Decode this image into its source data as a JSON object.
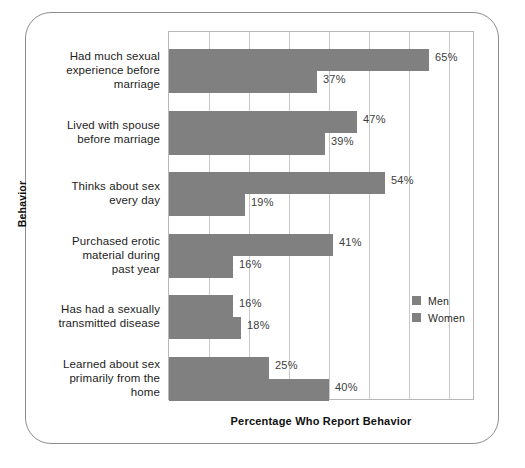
{
  "chart_data": {
    "type": "bar",
    "orientation": "horizontal",
    "title": "",
    "xlabel": "Percentage Who Report Behavior",
    "ylabel": "Behavior",
    "xlim": [
      0,
      76.5
    ],
    "xtick_step": 10,
    "grid": true,
    "value_suffix": "%",
    "legend_position": "center-right",
    "categories": [
      "Had much sexual experience before marriage",
      "Lived with spouse before marriage",
      "Thinks about sex every day",
      "Purchased erotic material during past year",
      "Has had a sexually transmitted disease",
      "Learned about sex primarily from the home"
    ],
    "category_lines": [
      [
        "Had much sexual",
        "experience before",
        "marriage"
      ],
      [
        "Lived with spouse",
        "before marriage"
      ],
      [
        "Thinks about sex",
        "every day"
      ],
      [
        "Purchased erotic",
        "material during",
        "past year"
      ],
      [
        "Has had a sexually",
        "transmitted disease"
      ],
      [
        "Learned about sex",
        "primarily from the",
        "home"
      ]
    ],
    "series": [
      {
        "name": "Men",
        "color": "#808080",
        "values": [
          65,
          47,
          54,
          41,
          16,
          25
        ],
        "labels": [
          "65%",
          "47%",
          "54%",
          "41%",
          "16%",
          "25%"
        ]
      },
      {
        "name": "Women",
        "color": "#808080",
        "values": [
          37,
          39,
          19,
          16,
          18,
          40
        ],
        "labels": [
          "37%",
          "39%",
          "19%",
          "16%",
          "18%",
          "40%"
        ]
      }
    ]
  },
  "legend": {
    "items": [
      {
        "label": "Men",
        "color": "#808080"
      },
      {
        "label": "Women",
        "color": "#808080"
      }
    ]
  },
  "axes": {
    "x_title": "Percentage Who Report Behavior",
    "y_title": "Behavior"
  },
  "colors": {
    "bar": "#808080",
    "gridline": "#c9c9c9",
    "plot_border": "#b7b7b7",
    "frame_border": "#8d8d8d",
    "text": "#1d1d1d",
    "background": "#ffffff"
  }
}
